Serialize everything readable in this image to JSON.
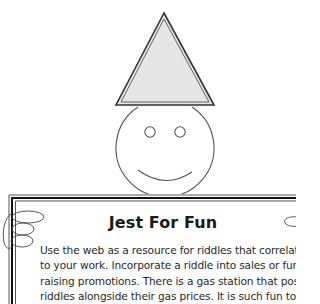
{
  "illustration": {
    "description": "Clown face with party hat",
    "hat_fill": "#e4e4e4",
    "stroke": "#444444"
  },
  "panel": {
    "title": "Jest For Fun",
    "body_lines": [
      "Use the web as a resource for riddles that correlate",
      "to your work. Incorporate a riddle into sales or fund-",
      "raising promotions. There is a gas station that posts",
      "riddles alongside their gas prices. It is such fun to try"
    ]
  }
}
